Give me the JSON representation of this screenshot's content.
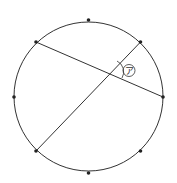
{
  "diagram": {
    "circle": {
      "cx": 88.5,
      "cy": 96.5,
      "r": 74.5,
      "stroke": "#333333"
    },
    "points": [
      {
        "name": "top",
        "x": 88.5,
        "y": 20
      },
      {
        "name": "top-right",
        "x": 140.5,
        "y": 42
      },
      {
        "name": "right",
        "x": 163,
        "y": 97
      },
      {
        "name": "bottom-right",
        "x": 140.5,
        "y": 151
      },
      {
        "name": "bottom",
        "x": 88.5,
        "y": 173
      },
      {
        "name": "bottom-left",
        "x": 36,
        "y": 151
      },
      {
        "name": "left",
        "x": 14,
        "y": 97
      },
      {
        "name": "top-left",
        "x": 36,
        "y": 42
      }
    ],
    "chords": [
      {
        "from": "top-left",
        "to": "right"
      },
      {
        "from": "bottom-left",
        "to": "top-right"
      }
    ],
    "angle_label": {
      "text": "ア",
      "x": 129,
      "y": 70.5
    }
  }
}
